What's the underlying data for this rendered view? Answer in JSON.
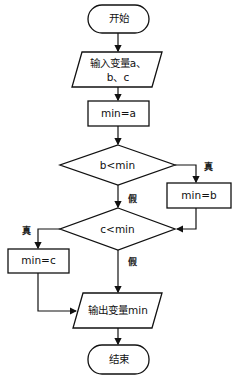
{
  "flowchart": {
    "start": "开始",
    "input_line1": "输入变量a、",
    "input_line2": "b、c",
    "assign_a": "min=a",
    "cond_b": "b<min",
    "assign_b": "min=b",
    "cond_c": "c<min",
    "assign_c": "min=c",
    "output": "输出变量min",
    "end": "结束",
    "true_label": "真",
    "false_label": "假"
  }
}
